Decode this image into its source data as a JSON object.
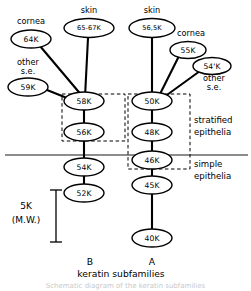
{
  "figure": {
    "panels": {
      "left_label": "B",
      "right_label": "A",
      "caption": "keratin subfamilies",
      "caption_fragment": "Schematic diagram of the keratin subfamilies"
    },
    "regions": {
      "stratified_line1": "stratified",
      "stratified_line2": "epithelia",
      "simple_line1": "simple",
      "simple_line2": "epithelia"
    },
    "scale": {
      "value": "5K",
      "unit": "(M.W.)"
    },
    "tissue_labels": {
      "cornea_left": "cornea",
      "skin_left": "skin",
      "skin_right": "skin",
      "cornea_right": "cornea",
      "other_se_left_line1": "other",
      "other_se_left_line2": "s.e.",
      "other_se_right_line1": "other",
      "other_se_right_line2": "s.e."
    },
    "nodes": {
      "cornea64": "64K",
      "skin6567": "65-67K",
      "other59": "59K",
      "k58": "58K",
      "k56": "56K",
      "k54": "54K",
      "k52": "52K",
      "skin565": "56,5K",
      "cornea55": "55K",
      "other54prime": "54'K",
      "k50": "50K",
      "k48": "48K",
      "k46": "46K",
      "k45": "45K",
      "k40": "40K"
    }
  }
}
